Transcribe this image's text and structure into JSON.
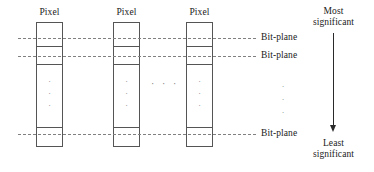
{
  "figure": {
    "background_color": "#ffffff",
    "line_color": "#555555",
    "dash_color": "#808080",
    "text_color": "#1a1a1a",
    "width": 374,
    "height": 172
  },
  "columns": [
    {
      "label": "Pixel",
      "x": 36,
      "width": 27
    },
    {
      "label": "Pixel",
      "x": 113,
      "width": 27
    },
    {
      "label": "Pixel",
      "x": 186,
      "width": 27
    }
  ],
  "column_top": 22,
  "column_bottom": 147,
  "cell_dividers": [
    45,
    63,
    126
  ],
  "column_ellipsis": {
    "dots": [
      "·",
      "·",
      "·"
    ],
    "top": 76
  },
  "between_columns_ellipsis": "· · ·",
  "bit_plane_lines": [
    {
      "y": 38,
      "label": "Bit-plane"
    },
    {
      "y": 56,
      "label": "Bit-plane"
    },
    {
      "y": 134,
      "label": "Bit-plane"
    }
  ],
  "bit_plane_line_start_x": 18,
  "bit_plane_line_end_x": 256,
  "bit_plane_label_x": 261,
  "right_ellipsis": {
    "dots": [
      "·",
      "·",
      "·"
    ],
    "x": 278,
    "top": 80
  },
  "significance_axis": {
    "top_label_line1": "Most",
    "top_label_line2": "significant",
    "bottom_label_line1": "Least",
    "bottom_label_line2": "significant",
    "arrow_x": 333,
    "arrow_top": 33,
    "arrow_bottom": 126
  }
}
